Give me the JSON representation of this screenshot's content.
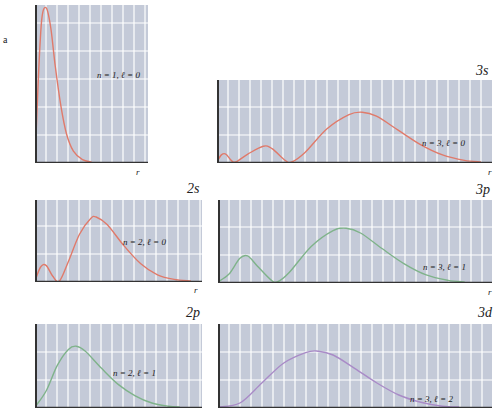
{
  "figure": {
    "side_label": "a",
    "background_color": "#c4cad8",
    "grid_color": "#ffffff",
    "axis_color": "#333333"
  },
  "chart_data": [
    {
      "id": "1s",
      "type": "line",
      "title": "",
      "orbital_label": "",
      "annotation": "n = 1, ℓ = 0",
      "xlabel": "r",
      "ylabel": "",
      "color": "#e07a6a",
      "n": 1,
      "l": 0,
      "xlim": [
        0,
        10
      ],
      "ylim": [
        0,
        1
      ],
      "grid": true,
      "points": [
        [
          0,
          0
        ],
        [
          0.3,
          0.55
        ],
        [
          0.6,
          0.93
        ],
        [
          1.0,
          1.0
        ],
        [
          1.4,
          0.87
        ],
        [
          1.8,
          0.62
        ],
        [
          2.3,
          0.36
        ],
        [
          2.8,
          0.18
        ],
        [
          3.4,
          0.07
        ],
        [
          4.2,
          0.015
        ],
        [
          5,
          0
        ]
      ]
    },
    {
      "id": "2s",
      "type": "line",
      "orbital_label": "2s",
      "annotation": "n = 2, ℓ = 0",
      "xlabel": "r",
      "color": "#e07a6a",
      "n": 2,
      "l": 0,
      "xlim": [
        0,
        15
      ],
      "ylim": [
        0,
        1
      ],
      "grid": true,
      "points": [
        [
          0,
          0
        ],
        [
          0.5,
          0.18
        ],
        [
          1.0,
          0.2
        ],
        [
          1.6,
          0.06
        ],
        [
          2.2,
          0
        ],
        [
          3,
          0.25
        ],
        [
          4,
          0.6
        ],
        [
          5,
          0.8
        ],
        [
          5.5,
          0.82
        ],
        [
          6.5,
          0.72
        ],
        [
          8,
          0.45
        ],
        [
          9.5,
          0.22
        ],
        [
          11,
          0.08
        ],
        [
          12.5,
          0.02
        ],
        [
          14,
          0
        ]
      ]
    },
    {
      "id": "2p",
      "type": "line",
      "orbital_label": "2p",
      "annotation": "n = 2, ℓ = 1",
      "xlabel": "r",
      "color": "#7fb38a",
      "n": 2,
      "l": 1,
      "xlim": [
        0,
        15
      ],
      "ylim": [
        0,
        1
      ],
      "grid": true,
      "points": [
        [
          0,
          0
        ],
        [
          1,
          0.2
        ],
        [
          2,
          0.52
        ],
        [
          3,
          0.72
        ],
        [
          3.7,
          0.76
        ],
        [
          4.5,
          0.7
        ],
        [
          6,
          0.48
        ],
        [
          7.5,
          0.28
        ],
        [
          9,
          0.14
        ],
        [
          10.5,
          0.05
        ],
        [
          12,
          0.01
        ],
        [
          13,
          0
        ]
      ]
    },
    {
      "id": "3s",
      "type": "line",
      "orbital_label": "3s",
      "annotation": "n = 3, ℓ = 0",
      "xlabel": "r",
      "color": "#e07a6a",
      "n": 3,
      "l": 0,
      "xlim": [
        0,
        25
      ],
      "ylim": [
        0,
        1
      ],
      "grid": true,
      "points": [
        [
          0,
          0
        ],
        [
          0.4,
          0.09
        ],
        [
          0.8,
          0.1
        ],
        [
          1.3,
          0.02
        ],
        [
          1.7,
          0
        ],
        [
          2.8,
          0.1
        ],
        [
          4.2,
          0.2
        ],
        [
          5,
          0.17
        ],
        [
          6.2,
          0.02
        ],
        [
          6.8,
          0
        ],
        [
          8,
          0.12
        ],
        [
          10,
          0.42
        ],
        [
          12,
          0.6
        ],
        [
          13.2,
          0.63
        ],
        [
          14.5,
          0.58
        ],
        [
          16.5,
          0.4
        ],
        [
          18.5,
          0.22
        ],
        [
          20.5,
          0.09
        ],
        [
          22.5,
          0.02
        ],
        [
          24,
          0
        ]
      ]
    },
    {
      "id": "3p",
      "type": "line",
      "orbital_label": "3p",
      "annotation": "n = 3, ℓ = 1",
      "xlabel": "r",
      "color": "#7fb38a",
      "n": 3,
      "l": 1,
      "xlim": [
        0,
        25
      ],
      "ylim": [
        0,
        1
      ],
      "grid": true,
      "points": [
        [
          0,
          0
        ],
        [
          1,
          0.1
        ],
        [
          2,
          0.3
        ],
        [
          2.7,
          0.33
        ],
        [
          3.6,
          0.2
        ],
        [
          4.8,
          0.03
        ],
        [
          5.4,
          0
        ],
        [
          6.5,
          0.12
        ],
        [
          8.5,
          0.45
        ],
        [
          10.5,
          0.65
        ],
        [
          11.7,
          0.68
        ],
        [
          13,
          0.62
        ],
        [
          15,
          0.42
        ],
        [
          17,
          0.23
        ],
        [
          19,
          0.09
        ],
        [
          21,
          0.02
        ],
        [
          22.5,
          0
        ]
      ]
    },
    {
      "id": "3d",
      "type": "line",
      "orbital_label": "3d",
      "annotation": "n = 3, ℓ = 2",
      "xlabel": "r",
      "color": "#a98bc7",
      "n": 3,
      "l": 2,
      "xlim": [
        0,
        25
      ],
      "ylim": [
        0,
        1
      ],
      "grid": true,
      "points": [
        [
          0,
          0
        ],
        [
          2,
          0.05
        ],
        [
          4,
          0.3
        ],
        [
          6,
          0.55
        ],
        [
          8,
          0.68
        ],
        [
          9,
          0.7
        ],
        [
          10.5,
          0.65
        ],
        [
          12.5,
          0.48
        ],
        [
          14.5,
          0.3
        ],
        [
          16.5,
          0.15
        ],
        [
          18.5,
          0.06
        ],
        [
          20.5,
          0.01
        ],
        [
          22,
          0
        ]
      ]
    }
  ]
}
